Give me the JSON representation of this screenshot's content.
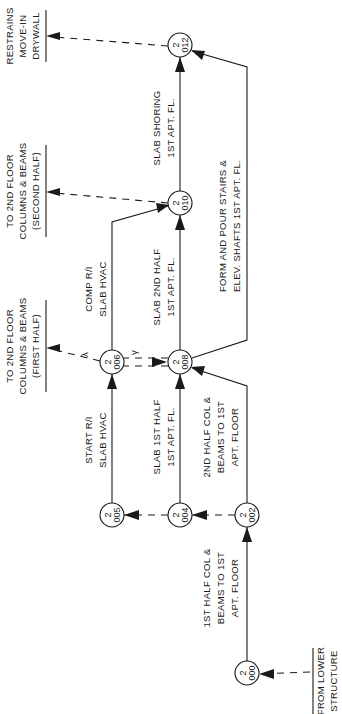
{
  "diagram": {
    "type": "activity-on-node network (CPM)",
    "nodes": [
      {
        "id": "n000",
        "top": "2",
        "bottom": "000"
      },
      {
        "id": "n002",
        "top": "2",
        "bottom": "002"
      },
      {
        "id": "n004",
        "top": "2",
        "bottom": "004"
      },
      {
        "id": "n005",
        "top": "2",
        "bottom": "005"
      },
      {
        "id": "n006",
        "top": "2",
        "bottom": "006"
      },
      {
        "id": "n008",
        "top": "2",
        "bottom": "008"
      },
      {
        "id": "n010",
        "top": "2",
        "bottom": "010"
      },
      {
        "id": "n012",
        "top": "2",
        "bottom": "012"
      }
    ],
    "activities": {
      "a000_002": [
        "1ST HALF COL &",
        "BEAMS TO 1ST",
        "APT. FLOOR"
      ],
      "a002_008": [
        "2ND HALF COL &",
        "BEAMS TO 1ST",
        "APT. FLOOR"
      ],
      "a004_008": [
        "SLAB 1ST HALF",
        "1ST APT. FL."
      ],
      "a005_006": [
        "START R/I",
        "SLAB HVAC"
      ],
      "a006_010": [
        "COMP R/I",
        "SLAB HVAC"
      ],
      "a008_010": [
        "SLAB 2ND HALF",
        "1ST APT. FL."
      ],
      "a010_012": [
        "SLAB SHORING",
        "1ST APT. FL."
      ],
      "a008_012": [
        "FORM AND POUR STAIRS &",
        "ELEV. SHAFTS 1ST APT. FL."
      ]
    },
    "external": {
      "restrains": [
        "RESTRAINS",
        "MOVE-IN",
        "DRYWALL"
      ],
      "second_half": [
        "TO 2ND FLOOR",
        "COLUMNS & BEAMS",
        "(SECOND HALF)"
      ],
      "first_half": [
        "TO 2ND FLOOR",
        "COLUMNS & BEAMS",
        "(FIRST HALF)"
      ],
      "from_lower": [
        "FROM LOWER",
        "STRUCTURE"
      ]
    },
    "lag_marks": [
      "λ",
      "γ"
    ]
  }
}
